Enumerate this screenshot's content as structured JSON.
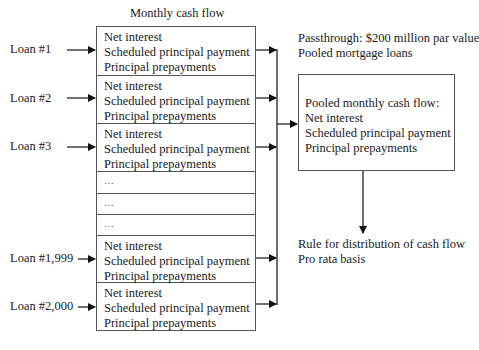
{
  "title": "Monthly cash flow",
  "loans": [
    {
      "label": "Loan #1",
      "lines": [
        "Net interest",
        "Scheduled principal payment",
        "Principal prepayments"
      ]
    },
    {
      "label": "Loan #2",
      "lines": [
        "Net interest",
        "Scheduled principal payment",
        "Principal prepayments"
      ]
    },
    {
      "label": "Loan #3",
      "lines": [
        "Net interest",
        "Scheduled principal payment",
        "Principal prepayments"
      ]
    },
    {
      "label": "Loan #1,999",
      "lines": [
        "Net interest",
        "Scheduled principal payment",
        "Principal prepayments"
      ]
    },
    {
      "label": "Loan #2,000",
      "lines": [
        "Net interest",
        "Scheduled principal payment",
        "Principal prepayments"
      ]
    }
  ],
  "ellipsis_rows": [
    "…",
    "…",
    "…"
  ],
  "passthrough": {
    "line1": "Passthrough: $200 million par value",
    "line2": "Pooled mortgage loans"
  },
  "pooled_box": {
    "lines": [
      "Pooled monthly cash flow:",
      "Net interest",
      "Scheduled principal payment",
      "Principal prepayments"
    ]
  },
  "distribution": {
    "line1": "Rule for distribution of cash flow",
    "line2": "Pro rata basis"
  }
}
